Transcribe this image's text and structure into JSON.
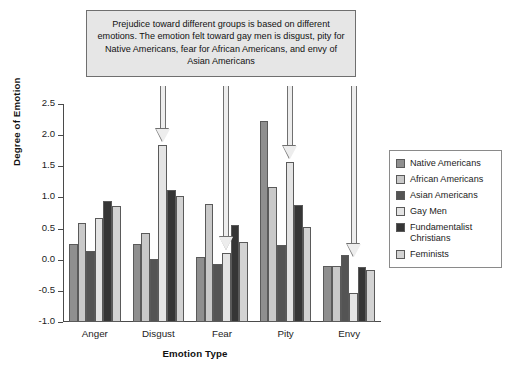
{
  "chart_data": {
    "type": "bar",
    "title": "",
    "xlabel": "Emotion Type",
    "ylabel": "Degree of Emotion",
    "categories": [
      "Anger",
      "Disgust",
      "Fear",
      "Pity",
      "Envy"
    ],
    "ylim": [
      -1.0,
      2.5
    ],
    "yticks": [
      "2.5",
      "2.0",
      "1.5",
      "1.0",
      "0.5",
      "0.0",
      "-0.5",
      "-1.0"
    ],
    "ytick_values": [
      2.5,
      2.0,
      1.5,
      1.0,
      0.5,
      0.0,
      -0.5,
      -1.0
    ],
    "grid": false,
    "legend_position": "right",
    "series": [
      {
        "name": "Native Americans",
        "color": "#8f8f8f",
        "values": [
          0.26,
          0.26,
          0.04,
          2.22,
          -0.1
        ]
      },
      {
        "name": "African Americans",
        "color": "#c9c9c9",
        "values": [
          0.59,
          0.43,
          0.9,
          1.16,
          -0.1
        ]
      },
      {
        "name": "Asian Americans",
        "color": "#545454",
        "values": [
          0.14,
          0.01,
          -0.07,
          0.24,
          0.07
        ]
      },
      {
        "name": "Gay Men",
        "color": "#e4e4e4",
        "values": [
          0.67,
          1.85,
          0.11,
          1.57,
          -0.53
        ]
      },
      {
        "name": "Fundamentalist Christians",
        "color": "#363636",
        "values": [
          0.95,
          1.12,
          0.56,
          0.88,
          -0.12
        ]
      },
      {
        "name": "Feminists",
        "color": "#d3d3d3",
        "values": [
          0.87,
          1.02,
          0.28,
          0.53,
          -0.16
        ]
      }
    ],
    "annotation": {
      "text": "Prejudice toward different groups is based on different emotions. The emotion felt toward gay men is disgust, pity for Native Americans, fear for African Americans, and envy of Asian Americans",
      "pointers": [
        {
          "category": "Disgust",
          "series": "Gay Men"
        },
        {
          "category": "Fear",
          "series": "Gay Men"
        },
        {
          "category": "Pity",
          "series": "Gay Men"
        },
        {
          "category": "Envy",
          "series": "Gay Men"
        }
      ]
    }
  },
  "legend": {
    "items": [
      {
        "label": "Native Americans"
      },
      {
        "label": "African Americans"
      },
      {
        "label": "Asian Americans"
      },
      {
        "label": "Gay Men"
      },
      {
        "label": "Fundamentalist Christians"
      },
      {
        "label": "Feminists"
      }
    ]
  }
}
